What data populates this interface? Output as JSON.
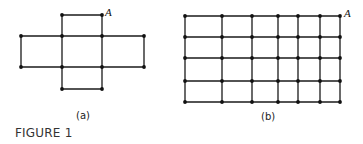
{
  "figure": {
    "caption": "FIGURE 1",
    "edge_color": "#1a1a1a",
    "vertex_color": "#111111"
  },
  "graph_a": {
    "label": "(a)",
    "vertex_label": "A",
    "xs": [
      21,
      62,
      102,
      144
    ],
    "ys": [
      15,
      36,
      67,
      89
    ],
    "vertices": [
      [
        1,
        0
      ],
      [
        2,
        0
      ],
      [
        0,
        1
      ],
      [
        1,
        1
      ],
      [
        2,
        1
      ],
      [
        3,
        1
      ],
      [
        0,
        2
      ],
      [
        1,
        2
      ],
      [
        2,
        2
      ],
      [
        3,
        2
      ],
      [
        1,
        3
      ],
      [
        2,
        3
      ]
    ],
    "edges": [
      [
        [
          1,
          0
        ],
        [
          2,
          0
        ]
      ],
      [
        [
          1,
          0
        ],
        [
          1,
          1
        ]
      ],
      [
        [
          2,
          0
        ],
        [
          2,
          1
        ]
      ],
      [
        [
          0,
          1
        ],
        [
          1,
          1
        ]
      ],
      [
        [
          1,
          1
        ],
        [
          2,
          1
        ]
      ],
      [
        [
          2,
          1
        ],
        [
          3,
          1
        ]
      ],
      [
        [
          0,
          1
        ],
        [
          0,
          2
        ]
      ],
      [
        [
          1,
          1
        ],
        [
          1,
          2
        ]
      ],
      [
        [
          2,
          1
        ],
        [
          2,
          2
        ]
      ],
      [
        [
          3,
          1
        ],
        [
          3,
          2
        ]
      ],
      [
        [
          0,
          2
        ],
        [
          1,
          2
        ]
      ],
      [
        [
          1,
          2
        ],
        [
          2,
          2
        ]
      ],
      [
        [
          2,
          2
        ],
        [
          3,
          2
        ]
      ],
      [
        [
          1,
          2
        ],
        [
          1,
          3
        ]
      ],
      [
        [
          2,
          2
        ],
        [
          2,
          3
        ]
      ],
      [
        [
          1,
          3
        ],
        [
          2,
          3
        ]
      ]
    ],
    "A_at": [
      2,
      0
    ]
  },
  "graph_b": {
    "label": "(b)",
    "vertex_label": "A",
    "xs": [
      185,
      222,
      252,
      278,
      298,
      320,
      340
    ],
    "ys": [
      16,
      37,
      58,
      81,
      102
    ],
    "A_at": [
      6,
      0
    ]
  }
}
